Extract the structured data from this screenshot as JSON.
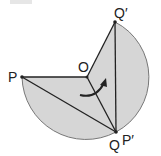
{
  "figure": {
    "colors": {
      "fill": "#d6d6d6",
      "stroke": "#222222",
      "arc_stroke": "#777777",
      "corner_box": "#e6e6e6"
    },
    "points": {
      "P": {
        "label": "P",
        "x": 22,
        "y": 77
      },
      "O": {
        "label": "O",
        "x": 87,
        "y": 77
      },
      "Q_prime": {
        "label": "Q′",
        "x": 115,
        "y": 22
      },
      "Q": {
        "label": "Q",
        "x": 116,
        "y": 132
      },
      "P_prime": {
        "label": "P′"
      }
    },
    "arrow": {
      "meaning": "rotation-direction"
    }
  }
}
